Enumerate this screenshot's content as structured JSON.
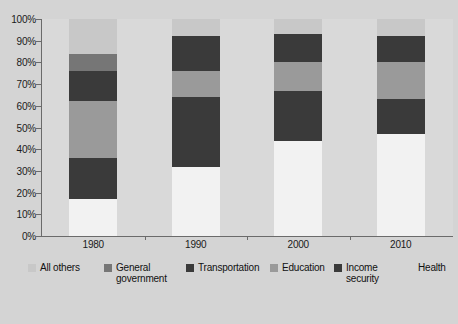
{
  "chart_data": {
    "type": "bar",
    "subtype": "stacked-100-percent",
    "title": "",
    "xlabel": "",
    "ylabel": "",
    "categories": [
      "1980",
      "1990",
      "2000",
      "2010"
    ],
    "ylim": [
      0,
      100
    ],
    "ytick_labels": [
      "0%",
      "10%",
      "20%",
      "30%",
      "40%",
      "50%",
      "60%",
      "70%",
      "80%",
      "90%",
      "100%"
    ],
    "ytick_values": [
      0,
      10,
      20,
      30,
      40,
      50,
      60,
      70,
      80,
      90,
      100
    ],
    "grid": false,
    "legend_position": "bottom",
    "stack_order_bottom_to_top": [
      "Health",
      "Income security",
      "Education",
      "Transportation",
      "General government",
      "All others"
    ],
    "series": [
      {
        "name": "Health",
        "color": "#f2f2f2",
        "values": [
          17,
          32,
          44,
          47
        ]
      },
      {
        "name": "Income security",
        "color": "#3a3a3a",
        "values": [
          19,
          32,
          23,
          16
        ]
      },
      {
        "name": "Education",
        "color": "#9a9a9a",
        "values": [
          26,
          12,
          13,
          17
        ]
      },
      {
        "name": "Transportation",
        "color": "#3a3a3a",
        "values": [
          14,
          16,
          13,
          12
        ]
      },
      {
        "name": "General government",
        "color": "#767676",
        "values": [
          8,
          0,
          0,
          0
        ]
      },
      {
        "name": "All others",
        "color": "#c8c8c8",
        "values": [
          16,
          8,
          7,
          8
        ]
      }
    ],
    "cumulative_tops": {
      "1980": [
        17,
        36,
        62,
        76,
        84,
        100
      ],
      "1990": [
        32,
        64,
        76,
        92,
        92,
        100
      ],
      "2000": [
        44,
        67,
        80,
        93,
        93,
        100
      ],
      "2010": [
        47,
        63,
        80,
        92,
        92,
        100
      ]
    }
  },
  "legend": {
    "items": [
      {
        "label": "All others",
        "color": "#c8c8c8",
        "has_swatch": true
      },
      {
        "label": "General government",
        "color": "#767676",
        "has_swatch": true
      },
      {
        "label": "Transportation",
        "color": "#3a3a3a",
        "has_swatch": true
      },
      {
        "label": "Education",
        "color": "#9a9a9a",
        "has_swatch": true
      },
      {
        "label": "Income security",
        "color": "#3a3a3a",
        "has_swatch": true
      },
      {
        "label": "Health",
        "color": "#f2f2f2",
        "has_swatch": false
      }
    ]
  },
  "colors": {
    "background": "#d4d4d4",
    "plot_background": "#d9d9d9",
    "axis_line": "#6b6b6b",
    "text": "#1a1a1a"
  }
}
